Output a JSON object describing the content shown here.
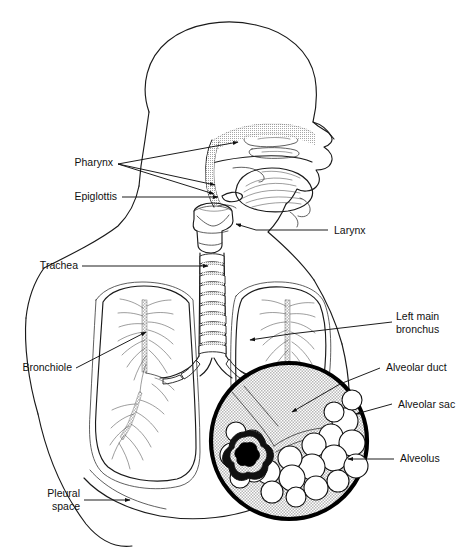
{
  "figure": {
    "background_color": "#ffffff",
    "line_color": "#1a1a1a",
    "width": 466,
    "height": 549
  },
  "labels": {
    "pharynx": "Pharynx",
    "epiglottis": "Epiglottis",
    "trachea": "Trachea",
    "bronchiole": "Bronchiole",
    "pleural_line1": "Pleural",
    "pleural_line2": "space",
    "larynx": "Larynx",
    "left_main_line1": "Left main",
    "left_main_line2": "bronchus",
    "alveolar_duct": "Alveolar duct",
    "alveolar_sac": "Alveolar sac",
    "alveolus": "Alveolus"
  },
  "structures": {
    "head": "head-profile-outline",
    "nasal_cavity": "nasal-cavity-cross-section",
    "tongue": "tongue",
    "larynx": "larynx-cartilage",
    "trachea": "trachea-with-cartilage-rings",
    "trachea_ring_count": 14,
    "left_lung": "left-lung-with-bronchial-tree",
    "right_lung": "right-lung-with-bronchial-tree",
    "diaphragm": "diaphragm-outline",
    "magnifier": "alveoli-magnification-circle",
    "alveoli_cluster": "grape-like-alveoli-cluster",
    "capillary_network": "capillary-covered-alveolus"
  },
  "colors": {
    "outline": "#1a1a1a",
    "magnifier_fill": "#d9d9d9",
    "magnifier_border": "#000000",
    "capillary": "#000000"
  }
}
